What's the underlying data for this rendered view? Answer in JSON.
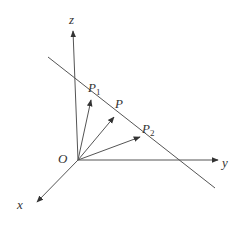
{
  "diagram": {
    "title": "",
    "colors": {
      "stroke": "#555555",
      "text": "#333333",
      "background": "#ffffff"
    },
    "origin": {
      "label": "O",
      "x": 78,
      "y": 160
    },
    "axes": [
      {
        "name": "z",
        "label": "z",
        "tip": [
          73,
          30
        ],
        "label_pos": [
          69,
          24
        ]
      },
      {
        "name": "y",
        "label": "y",
        "tip": [
          219,
          160
        ],
        "label_pos": [
          223,
          167
        ]
      },
      {
        "name": "x",
        "label": "x",
        "tip": [
          36,
          203
        ],
        "label_pos": [
          17,
          209
        ]
      }
    ],
    "line": {
      "from": [
        48,
        57
      ],
      "to": [
        215,
        188
      ]
    },
    "vectors": [
      {
        "name": "P1",
        "label": "P",
        "subscript": "1",
        "tip": [
          91,
          99
        ],
        "label_pos": [
          89,
          92
        ]
      },
      {
        "name": "P",
        "label": "P",
        "subscript": "",
        "tip": [
          115,
          116
        ],
        "label_pos": [
          115,
          108
        ]
      },
      {
        "name": "P2",
        "label": "P",
        "subscript": "2",
        "tip": [
          141,
          136
        ],
        "label_pos": [
          142,
          134
        ]
      }
    ]
  }
}
